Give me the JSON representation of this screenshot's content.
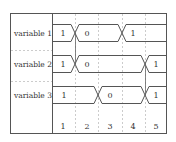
{
  "diagram": {
    "type": "timing-diagram",
    "signals": [
      {
        "label": "variable 1",
        "segments": [
          {
            "from": 0,
            "to": 1,
            "value": "1"
          },
          {
            "from": 1,
            "to": 3,
            "value": "0"
          },
          {
            "from": 3,
            "to": 5,
            "value": "1"
          }
        ]
      },
      {
        "label": "variable 2",
        "segments": [
          {
            "from": 0,
            "to": 1,
            "value": "1"
          },
          {
            "from": 1,
            "to": 4,
            "value": "0"
          },
          {
            "from": 4,
            "to": 5,
            "value": "1"
          }
        ]
      },
      {
        "label": "variable 3",
        "segments": [
          {
            "from": 0,
            "to": 2,
            "value": "1"
          },
          {
            "from": 2,
            "to": 4,
            "value": "0"
          },
          {
            "from": 4,
            "to": 5,
            "value": "1"
          }
        ]
      }
    ],
    "time_labels": [
      "1",
      "2",
      "3",
      "4",
      "5"
    ],
    "causality_links": [
      {
        "from_signal": 0,
        "to_signal": 1,
        "at": 1
      },
      {
        "from_signal": 1,
        "to_signal": 2,
        "at": 4
      }
    ],
    "colors": {
      "line": "#555555",
      "grid": "#cccccc",
      "text": "#333333"
    }
  }
}
